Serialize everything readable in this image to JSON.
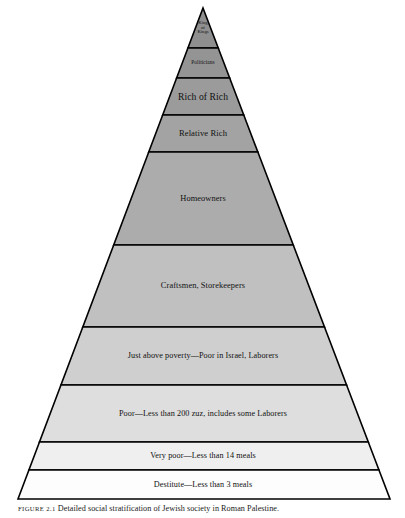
{
  "figure": {
    "caption_label": "FIGURE 2.1",
    "caption_text": "Detailed social stratification of Jewish society in Roman Palestine."
  },
  "chart_data": {
    "type": "pyramid",
    "title": "Detailed social stratification of Jewish society in Roman Palestine",
    "orientation": "apex-top",
    "apex": {
      "x": 203,
      "y": 8
    },
    "base": {
      "left_x": 18,
      "right_x": 390,
      "y": 499
    },
    "legend": "none",
    "grid": false,
    "note": "Ten horizontal strata; shading lightens from dark gray at the apex to white at the base.",
    "bands": [
      {
        "index": 0,
        "label": "King\nof\nKings",
        "label_lines": [
          "King",
          "of",
          "Kings"
        ],
        "top_y": 8,
        "bottom_y": 48,
        "fill": "#8f8f8f",
        "font_size": 4.6,
        "multiline": true
      },
      {
        "index": 1,
        "label": "Politicians",
        "label_lines": [
          "Politicians"
        ],
        "top_y": 48,
        "bottom_y": 78,
        "fill": "#949494",
        "font_size": 5.4,
        "multiline": false
      },
      {
        "index": 2,
        "label": "Rich of Rich",
        "label_lines": [
          "Rich of Rich"
        ],
        "top_y": 78,
        "bottom_y": 115,
        "fill": "#9b9b9b",
        "font_size": 9.6,
        "multiline": false
      },
      {
        "index": 3,
        "label": "Relative Rich",
        "label_lines": [
          "Relative Rich"
        ],
        "top_y": 115,
        "bottom_y": 152,
        "fill": "#a3a3a3",
        "font_size": 8.6,
        "multiline": false
      },
      {
        "index": 4,
        "label": "Homeowners",
        "label_lines": [
          "Homeowners"
        ],
        "top_y": 152,
        "bottom_y": 245,
        "fill": "#acacac",
        "font_size": 8.4,
        "multiline": false
      },
      {
        "index": 5,
        "label": "Craftsmen, Storekeepers",
        "label_lines": [
          "Craftsmen, Storekeepers"
        ],
        "top_y": 245,
        "bottom_y": 327,
        "fill": "#c0c0c0",
        "font_size": 8.4,
        "multiline": false
      },
      {
        "index": 6,
        "label": "Just above poverty—Poor in Israel, Laborers",
        "label_lines": [
          "Just above poverty—Poor in Israel, Laborers"
        ],
        "top_y": 327,
        "bottom_y": 385,
        "fill": "#cfcfcf",
        "font_size": 8.2,
        "multiline": false
      },
      {
        "index": 7,
        "label": "Poor—Less than 200 zuz, includes some Laborers",
        "label_lines": [
          "Poor—Less than 200 zuz, includes some Laborers"
        ],
        "top_y": 385,
        "bottom_y": 442,
        "fill": "#dedede",
        "font_size": 8.2,
        "multiline": false
      },
      {
        "index": 8,
        "label": "Very poor—Less than 14 meals",
        "label_lines": [
          "Very poor—Less than 14 meals"
        ],
        "top_y": 442,
        "bottom_y": 470,
        "fill": "#efefef",
        "font_size": 8.2,
        "multiline": false
      },
      {
        "index": 9,
        "label": "Destitute—Less than 3 meals",
        "label_lines": [
          "Destitute—Less than 3 meals"
        ],
        "top_y": 470,
        "bottom_y": 499,
        "fill": "#fdfdfd",
        "font_size": 8.2,
        "multiline": false
      }
    ]
  }
}
